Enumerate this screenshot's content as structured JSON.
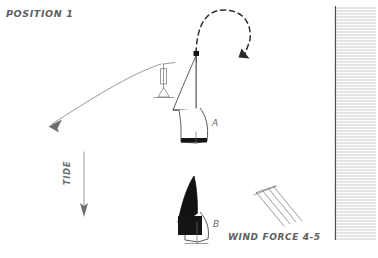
{
  "diagram": {
    "title": "POSITION 1",
    "background_color": "#ffffff",
    "ink_color": "#4a4a4a"
  },
  "boats": [
    {
      "id": "A",
      "label": "A",
      "sail_fill": "white",
      "sail_color": "#ffffff",
      "description": "sailboat with unfilled white sail"
    },
    {
      "id": "B",
      "label": "B",
      "sail_fill": "black",
      "sail_color": "#111111",
      "description": "sailboat with solid black sail"
    }
  ],
  "annotations": {
    "tide_label": "TIDE",
    "tide_direction": "downward",
    "wind_label": "WIND FORCE 4-5",
    "wind_barb_feathers": 4,
    "maneuver_arrow": "dashed u-turn",
    "mark_symbol": "buoy",
    "rode_arrow": "down-left"
  },
  "structures": {
    "quay_wall": "hatched vertical band",
    "hatch_color": "#b9bcc0"
  }
}
